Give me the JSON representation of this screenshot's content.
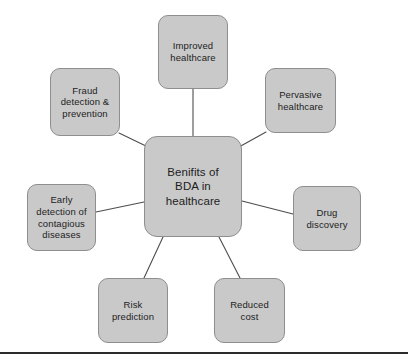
{
  "diagram": {
    "title": "Benifits of BDA in healthcare",
    "type": "hub-and-spoke mind map",
    "background_color": "#ffffff",
    "node_fill_color": "#c9c9c9",
    "node_border_color": "#8e8e8e",
    "connector_color": "#4d4d4d",
    "text_color": "#1d1d1d",
    "center": {
      "label": "Benifits of\nBDA in\nhealthcare",
      "x": 144,
      "y": 136,
      "width": 98,
      "height": 101
    },
    "nodes": [
      {
        "id": "improved-healthcare",
        "label": "Improved\nhealthcare",
        "x": 158,
        "y": 15,
        "width": 70,
        "height": 74
      },
      {
        "id": "pervasive-healthcare",
        "label": "Pervasive\nhealthcare",
        "x": 265,
        "y": 68,
        "width": 71,
        "height": 65
      },
      {
        "id": "fraud-detection-prevention",
        "label": "Fraud\ndetection &\nprevention",
        "x": 50,
        "y": 68,
        "width": 70,
        "height": 68
      },
      {
        "id": "early-detection-contagious-diseases",
        "label": "Early\ndetection of\ncontagious\ndiseases",
        "x": 27,
        "y": 184,
        "width": 69,
        "height": 67
      },
      {
        "id": "drug-discovery",
        "label": "Drug\ndiscovery",
        "x": 293,
        "y": 186,
        "width": 68,
        "height": 65
      },
      {
        "id": "risk-prediction",
        "label": "Risk\nprediction",
        "x": 98,
        "y": 278,
        "width": 70,
        "height": 65
      },
      {
        "id": "reduced-cost",
        "label": "Reduced\ncost",
        "x": 214,
        "y": 278,
        "width": 71,
        "height": 65
      }
    ],
    "connectors": [
      {
        "id": "center-to-improved-healthcare",
        "x1": 193,
        "y1": 136,
        "x2": 193,
        "y2": 89
      },
      {
        "id": "center-to-pervasive-healthcare",
        "x1": 239,
        "y1": 147,
        "x2": 266,
        "y2": 132
      },
      {
        "id": "center-to-fraud-detection",
        "x1": 148,
        "y1": 147,
        "x2": 119,
        "y2": 133
      },
      {
        "id": "center-to-early-detection",
        "x1": 144,
        "y1": 202,
        "x2": 96,
        "y2": 212
      },
      {
        "id": "center-to-drug-discovery",
        "x1": 242,
        "y1": 201,
        "x2": 293,
        "y2": 214
      },
      {
        "id": "center-to-risk-prediction",
        "x1": 163,
        "y1": 237,
        "x2": 144,
        "y2": 278
      },
      {
        "id": "center-to-reduced-cost",
        "x1": 219,
        "y1": 237,
        "x2": 240,
        "y2": 278
      }
    ],
    "bottom_rule": {
      "y": 352,
      "color": "#2b2b2b"
    }
  }
}
